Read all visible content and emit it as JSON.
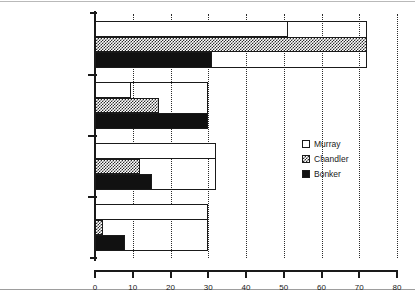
{
  "chart_data": {
    "type": "bar",
    "orientation": "horizontal",
    "title": "",
    "xlabel": "Percent",
    "ylabel": "",
    "xlim": [
      0,
      80
    ],
    "xticks": [
      0,
      10,
      20,
      30,
      40,
      50,
      60,
      70,
      80
    ],
    "xtick_labels": [
      "0",
      "10",
      "20",
      "30",
      "40",
      "50",
      "60",
      "70",
      "80"
    ],
    "grid": "vertical-dotted",
    "legend_position": "center-right",
    "categories": [
      "Male In State",
      "Male Out of State",
      "Female In State",
      "Female Out of State"
    ],
    "series": [
      {
        "name": "Murray",
        "fill": "white",
        "color": "#ffffff",
        "values": [
          51,
          9.5,
          32,
          30
        ]
      },
      {
        "name": "Chandler",
        "fill": "crosshatch",
        "color": "#2d2d2d",
        "values": [
          72,
          17,
          12,
          2
        ]
      },
      {
        "name": "Bonker",
        "fill": "solid",
        "color": "#111111",
        "values": [
          31,
          30,
          15,
          8
        ]
      }
    ]
  },
  "legend": {
    "items": [
      {
        "label": "Murray"
      },
      {
        "label": "Chandler"
      },
      {
        "label": "Bonker"
      }
    ]
  },
  "axis": {
    "x_title": "Percent"
  },
  "colors": {
    "ink": "#1a1a1a",
    "background": "#ffffff",
    "solid_series": "#111111",
    "hatch_series": "#2d2d2d"
  }
}
